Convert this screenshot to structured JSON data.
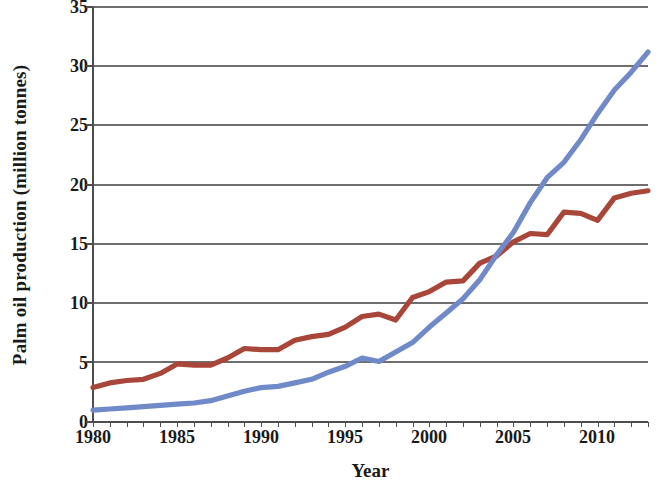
{
  "chart_data": {
    "type": "line",
    "title": "",
    "xlabel": "Year",
    "ylabel": "Palm oil production (million tonnes)",
    "xlim": [
      1980,
      2013
    ],
    "ylim": [
      0,
      35
    ],
    "xticks": [
      1980,
      1985,
      1990,
      1995,
      2000,
      2005,
      2010
    ],
    "yticks": [
      0,
      5,
      10,
      15,
      20,
      25,
      30,
      35
    ],
    "grid": "horizontal",
    "legend": "none",
    "x": [
      1980,
      1981,
      1982,
      1983,
      1984,
      1985,
      1986,
      1987,
      1988,
      1989,
      1990,
      1991,
      1992,
      1993,
      1994,
      1995,
      1996,
      1997,
      1998,
      1999,
      2000,
      2001,
      2002,
      2003,
      2004,
      2005,
      2006,
      2007,
      2008,
      2009,
      2010,
      2011,
      2012,
      2013
    ],
    "series": [
      {
        "name": "red-series",
        "color": "#a8463a",
        "values": [
          2.9,
          3.3,
          3.5,
          3.6,
          4.1,
          4.9,
          4.8,
          4.8,
          5.4,
          6.2,
          6.1,
          6.1,
          6.9,
          7.2,
          7.4,
          8.0,
          8.9,
          9.1,
          8.6,
          10.5,
          11.0,
          11.8,
          11.9,
          13.4,
          14.0,
          15.2,
          15.9,
          15.8,
          17.7,
          17.6,
          17.0,
          18.9,
          19.3,
          19.5
        ]
      },
      {
        "name": "blue-series",
        "color": "#7089c8",
        "values": [
          1.0,
          1.1,
          1.2,
          1.3,
          1.4,
          1.5,
          1.6,
          1.8,
          2.2,
          2.6,
          2.9,
          3.0,
          3.3,
          3.6,
          4.2,
          4.7,
          5.4,
          5.1,
          5.9,
          6.7,
          8.0,
          9.2,
          10.4,
          12.0,
          14.1,
          16.0,
          18.5,
          20.6,
          21.9,
          23.8,
          26.0,
          28.0,
          29.5,
          31.2
        ]
      }
    ]
  },
  "axes": {
    "y_label": "Palm oil production (million tonnes)",
    "x_label": "Year",
    "y_ticks": [
      "35",
      "30",
      "25",
      "20",
      "15",
      "10",
      "5",
      "0"
    ],
    "x_ticks": [
      "1980",
      "1985",
      "1990",
      "1995",
      "2000",
      "2005",
      "2010"
    ]
  },
  "style": {
    "background": "#ffffff",
    "axis_color": "#595959",
    "grid_color": "#808080",
    "text_color": "#1a1a1a",
    "red_series_color": "#a8463a",
    "blue_series_color": "#7089c8"
  }
}
